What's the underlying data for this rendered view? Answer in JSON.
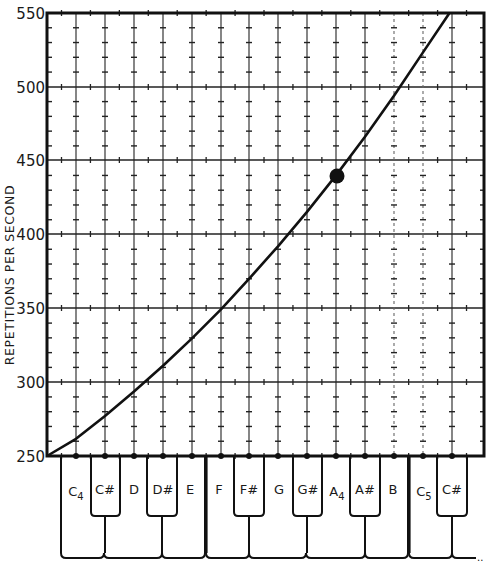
{
  "chart_data": {
    "type": "line",
    "title": "",
    "xlabel": "",
    "ylabel": "REPETITIONS PER SECOND",
    "ylim": [
      250,
      550
    ],
    "yticks": [
      250,
      300,
      350,
      400,
      450,
      500,
      550
    ],
    "grid": true,
    "categories": [
      "C4",
      "C#",
      "D",
      "D#",
      "E",
      "F",
      "F#",
      "G",
      "G#",
      "A4",
      "A#",
      "B",
      "C5",
      "C#"
    ],
    "series": [
      {
        "name": "Equal-tempered pitch frequency",
        "x": [
          "C4",
          "C#",
          "D",
          "D#",
          "E",
          "F",
          "F#",
          "G",
          "G#",
          "A4",
          "A#",
          "B",
          "C5",
          "C#"
        ],
        "values": [
          261.6,
          277.2,
          293.7,
          311.1,
          329.6,
          349.2,
          370.0,
          392.0,
          415.3,
          440.0,
          466.2,
          493.9,
          523.3,
          554.4
        ]
      }
    ],
    "annotations": [
      {
        "type": "marker",
        "label": "A4",
        "x": "A4",
        "y": 440,
        "shape": "filled-circle"
      }
    ],
    "keyboard": {
      "white_keys": [
        "C4",
        "D",
        "E",
        "F",
        "G",
        "A4",
        "B",
        "C5"
      ],
      "black_keys": [
        "C#",
        "D#",
        "F#",
        "G#",
        "A#",
        "C#"
      ]
    }
  },
  "axis": {
    "ylabel": "REPETITIONS PER SECOND",
    "yticks": [
      "550",
      "500",
      "450",
      "400",
      "350",
      "300",
      "250"
    ]
  },
  "keys": {
    "labels": [
      {
        "main": "C",
        "sub": "4"
      },
      {
        "main": "C#",
        "sub": ""
      },
      {
        "main": "D",
        "sub": ""
      },
      {
        "main": "D#",
        "sub": ""
      },
      {
        "main": "E",
        "sub": ""
      },
      {
        "main": "F",
        "sub": ""
      },
      {
        "main": "F#",
        "sub": ""
      },
      {
        "main": "G",
        "sub": ""
      },
      {
        "main": "G#",
        "sub": ""
      },
      {
        "main": "A",
        "sub": "4"
      },
      {
        "main": "A#",
        "sub": ""
      },
      {
        "main": "B",
        "sub": ""
      },
      {
        "main": "C",
        "sub": "5"
      },
      {
        "main": "C#",
        "sub": ""
      }
    ]
  },
  "colors": {
    "ink": "#1a1a1a",
    "paper": "#ffffff"
  }
}
